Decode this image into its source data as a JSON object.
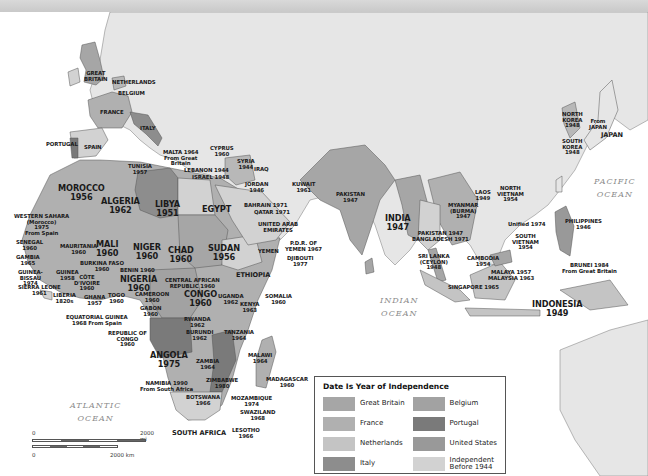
{
  "legend": {
    "title": "Date Is Year of Independence",
    "items": [
      {
        "label": "Great Britain",
        "color": "#a6a6a6"
      },
      {
        "label": "Belgium",
        "color": "#a2a2a2"
      },
      {
        "label": "France",
        "color": "#b0b0b0"
      },
      {
        "label": "Portugal",
        "color": "#7a7a7a"
      },
      {
        "label": "Netherlands",
        "color": "#c4c4c4"
      },
      {
        "label": "United States",
        "color": "#999999"
      },
      {
        "label": "Italy",
        "color": "#8d8d8d"
      },
      {
        "label": "Independent\nBefore 1944",
        "color": "#d2d2d2"
      }
    ]
  },
  "oceans": {
    "atlantic": "ATLANTIC\nOCEAN",
    "indian": "INDIAN\nOCEAN",
    "pacific": "PACIFIC\nOCEAN"
  },
  "scale": {
    "mi_zero": "0",
    "mi_end": "2000 mi",
    "km_zero": "0",
    "km_end": "2000 km"
  },
  "labels": {
    "great_britain": "GREAT\nBRITAIN",
    "netherlands": "NETHERLANDS",
    "belgium": "BELGIUM",
    "france": "FRANCE",
    "italy": "ITALY",
    "portugal": "PORTUGAL",
    "spain": "SPAIN",
    "malta": "MALTA 1964\nFrom Great\nBritain",
    "cyprus": "CYPRUS\n1960",
    "tunisia": "TUNISIA\n1957",
    "syria": "SYRIA\n1944",
    "lebanon": "LEBANON 1944",
    "israel": "ISRAEL 1948",
    "iraq": "IRAQ",
    "jordan": "JORDAN\n1946",
    "kuwait": "KUWAIT\n1961",
    "bahrain": "BAHRAIN 1971",
    "qatar": "QATAR 1971",
    "uae": "UNITED ARAB\nEMIRATES",
    "pdr_yemen": "P.D.R. OF\nYEMEN 1967",
    "yemen": "YEMEN",
    "djibouti": "DJIBOUTI\n1977",
    "morocco": "MOROCCO\n1956",
    "algeria": "ALGERIA\n1962",
    "libya": "LIBYA\n1951",
    "egypt": "EGYPT",
    "western_sahara": "WESTERN SAHARA\n(Morocco)\n1975\nFrom Spain",
    "mauritania": "MAURITANIA\n1960",
    "mali": "MALI\n1960",
    "niger": "NIGER\n1960",
    "chad": "CHAD\n1960",
    "sudan": "SUDAN\n1956",
    "ethiopia": "ETHIOPIA",
    "senegal": "SENEGAL\n1960",
    "gambia": "GAMBIA\n1965",
    "guinea_bissau": "GUINEA-\nBISSAU\n1974",
    "guinea": "GUINEA\n1958",
    "sierra_leone": "SIERRA LEONE\n1961",
    "liberia": "LIBERIA\n1820s",
    "cote_divoire": "CÔTE\nD'IVOIRE\n1960",
    "burkina_faso": "BURKINA FASO\n1960",
    "ghana": "GHANA\n1957",
    "togo": "TOGO\n1960",
    "benin": "BENIN 1960",
    "nigeria": "NIGERIA\n1960",
    "cameroon": "CAMEROON\n1960",
    "car": "CENTRAL AFRICAN\nREPUBLIC 1960",
    "eq_guinea": "EQUATORIAL GUINEA\n1968 From Spain",
    "gabon": "GABON\n1960",
    "rep_congo": "REPUBLIC OF\nCONGO\n1960",
    "congo": "CONGO\n1960",
    "uganda": "UGANDA\n1962",
    "kenya": "KENYA\n1963",
    "somalia": "SOMALIA\n1960",
    "rwanda": "RWANDA\n1962",
    "burundi": "BURUNDI\n1962",
    "tanzania": "TANZANIA\n1964",
    "angola": "ANGOLA\n1975",
    "zambia": "ZAMBIA\n1964",
    "malawi": "MALAWI\n1964",
    "zimbabwe": "ZIMBABWE\n1980",
    "namibia": "NAMIBIA 1990\nFrom South Africa",
    "botswana": "BOTSWANA\n1966",
    "mozambique": "MOZAMBIQUE\n1974",
    "madagascar": "MADAGASCAR\n1960",
    "swaziland": "SWAZILAND\n1968",
    "lesotho": "LESOTHO\n1966",
    "south_africa": "SOUTH AFRICA",
    "pakistan": "PAKISTAN\n1947",
    "india": "INDIA\n1947",
    "pakistan_bangladesh": "PAKISTAN 1947\nBANGLADESH 1971",
    "myanmar": "MYANMAR\n(BURMA)\n1947",
    "sri_lanka": "SRI LANKA\n(CEYLON)\n1948",
    "laos": "LAOS\n1949",
    "north_vietnam": "NORTH\nVIETNAM\n1954",
    "unified": "Unified 1974",
    "south_vietnam": "SOUTH\nVIETNAM\n1954",
    "cambodia": "CAMBODIA\n1954",
    "malaya": "MALAYA 1957\nMALAYSIA 1963",
    "singapore": "SINGAPORE 1965",
    "brunei": "BRUNEI 1984\nFrom Great Britain",
    "indonesia": "INDONESIA\n1949",
    "philippines": "PHILIPPINES\n1946",
    "north_korea": "NORTH\nKOREA\n1948",
    "south_korea": "SOUTH\nKOREA\n1948",
    "from_japan": "From\nJAPAN",
    "japan": "JAPAN"
  }
}
